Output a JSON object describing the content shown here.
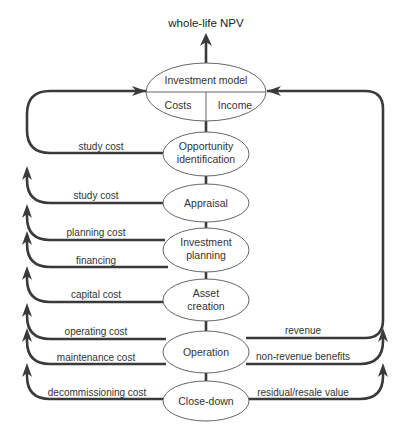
{
  "diagram": {
    "output_label": "whole-life NPV",
    "investment_model": {
      "title": "Investment model",
      "left": "Costs",
      "right": "Income"
    },
    "stages": [
      {
        "line1": "Opportunity",
        "line2": "identification"
      },
      {
        "line1": "Appraisal",
        "line2": ""
      },
      {
        "line1": "Investment",
        "line2": "planning"
      },
      {
        "line1": "Asset",
        "line2": "creation"
      },
      {
        "line1": "Operation",
        "line2": ""
      },
      {
        "line1": "Close-down",
        "line2": ""
      }
    ],
    "cost_flows": [
      "study cost",
      "study cost",
      "planning cost",
      "financing",
      "capital cost",
      "operating cost",
      "maintenance cost",
      "decommissioning cost"
    ],
    "income_flows": [
      "revenue",
      "non-revenue benefits",
      "residual/resale value"
    ],
    "colors": {
      "line": "#3a3a3a",
      "ellipse_stroke": "#555555",
      "text": "#333333"
    }
  }
}
